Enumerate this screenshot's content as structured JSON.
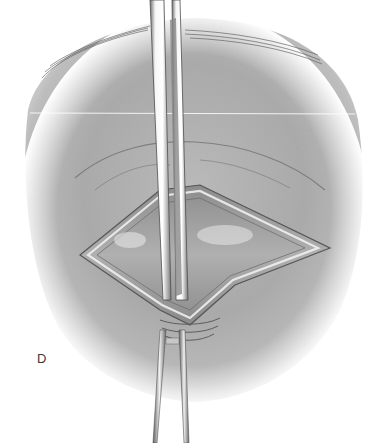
{
  "figure": {
    "panel_label": "D",
    "colors": {
      "skin_light": "#c9c9c9",
      "skin_mid": "#a9a9a9",
      "skin_dark": "#7a7a7a",
      "incision_inner": "#9a9a9a",
      "instrument_highlight": "#f4f4f4",
      "instrument_shadow": "#6d6d6d",
      "background": "#ffffff",
      "label": "#3a3a3a"
    }
  }
}
